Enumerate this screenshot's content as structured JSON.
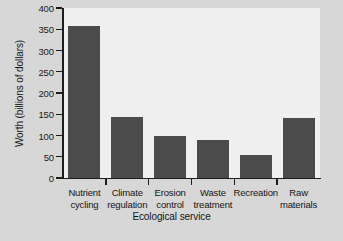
{
  "chart_data": {
    "type": "bar",
    "title": "",
    "xlabel": "Ecological service",
    "ylabel": "Worth (billions of dollars)",
    "categories": [
      "Nutrient cycling",
      "Climate regulation",
      "Erosion control",
      "Waste treatment",
      "Recreation",
      "Raw materials"
    ],
    "category_lines": [
      [
        "Nutrient",
        "cycling"
      ],
      [
        "Climate",
        "regulation"
      ],
      [
        "Erosion",
        "control"
      ],
      [
        "Waste",
        "treatment"
      ],
      [
        "Recreation",
        ""
      ],
      [
        "Raw",
        "materials"
      ]
    ],
    "values": [
      357,
      143,
      100,
      90,
      55,
      142
    ],
    "ylim": [
      0,
      400
    ],
    "yticks": [
      0,
      50,
      100,
      150,
      200,
      250,
      300,
      350,
      400
    ],
    "ytick_labels": [
      "0",
      "50",
      "100",
      "150",
      "200",
      "250",
      "300",
      "350",
      "400"
    ],
    "grid": false,
    "legend": "none",
    "bar_color": "#4b4b4b",
    "plot_background": "#efefef",
    "figure_background": "#d7d7d7",
    "axis_color": "#1d1d1d"
  }
}
